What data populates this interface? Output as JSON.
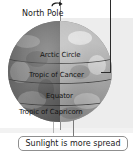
{
  "diagram": {
    "pole": {
      "label": "North Pole",
      "rotation_icon": "rotation-arrow-icon"
    },
    "globe": {
      "name": "earth-globe",
      "night_side_color": "#6d6d6d",
      "day_side_color": "#bdbdbd",
      "latitude_lines": [
        {
          "id": "arctic-circle",
          "label": "Arctic Circle",
          "top": 30,
          "left": 32
        },
        {
          "id": "tropic-of-cancer",
          "label": "Tropic of Cancer",
          "top": 50,
          "left": 22
        },
        {
          "id": "equator",
          "label": "Equator",
          "top": 72,
          "left": 40
        },
        {
          "id": "tropic-of-capricorn",
          "label": "Tropic of Capricorn",
          "top": 90,
          "left": 12
        }
      ]
    },
    "caption": {
      "text": "Sunlight is more spread"
    },
    "colors": {
      "leader_line": "#2b2b2b",
      "caption_border": "#8f8f8f",
      "label_text": "#141414",
      "background": "#ffffff"
    }
  }
}
